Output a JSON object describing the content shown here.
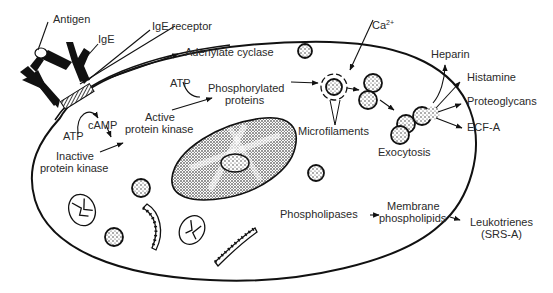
{
  "diagram": {
    "labels": {
      "antigen": "Antigen",
      "ige": "IgE",
      "ige_receptor": "IgE receptor",
      "adenylate_cyclase": "Adenylate cyclase",
      "ca": "Ca",
      "ca_sup": "2+",
      "atp_top": "ATP",
      "phosphorylated_1": "Phosphorylated",
      "phosphorylated_2": "proteins",
      "active_pk_1": "Active",
      "active_pk_2": "protein kinase",
      "atp_left": "ATP",
      "camp": "cAMP",
      "inactive_pk_1": "Inactive",
      "inactive_pk_2": "protein kinase",
      "microfilaments": "Microfilaments",
      "exocytosis": "Exocytosis",
      "heparin": "Heparin",
      "histamine": "Histamine",
      "proteoglycans": "Proteoglycans",
      "ecfa": "ECF-A",
      "phospholipases": "Phospholipases",
      "membrane_pl_1": "Membrane",
      "membrane_pl_2": "phospholipids",
      "leukotrienes_1": "Leukotrienes",
      "leukotrienes_2": "(SRS-A)"
    },
    "colors": {
      "ink": "#111111",
      "text": "#2a2a2a",
      "background": "#ffffff"
    }
  }
}
